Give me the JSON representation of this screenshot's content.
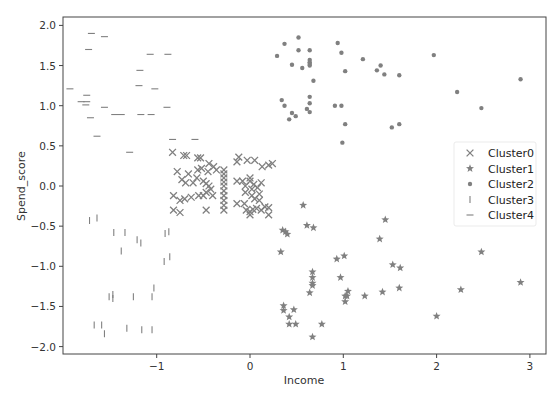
{
  "chart_data": {
    "type": "scatter",
    "title": "",
    "xlabel": "Income",
    "ylabel": "Spend_score",
    "xlim": [
      -1.98,
      3.18
    ],
    "ylim": [
      -2.1,
      2.1
    ],
    "xticks": [
      -1,
      0,
      1,
      2,
      3
    ],
    "xtick_labels": [
      "−1",
      "0",
      "1",
      "2",
      "3"
    ],
    "yticks": [
      -2.0,
      -1.5,
      -1.0,
      -0.5,
      0.0,
      0.5,
      1.0,
      1.5,
      2.0
    ],
    "ytick_labels": [
      "−2.0",
      "−1.5",
      "−1.0",
      "−0.5",
      "0.0",
      "0.5",
      "1.0",
      "1.5",
      "2.0"
    ],
    "grid": false,
    "legend_position": "center right",
    "marker_color": "#808080",
    "series": [
      {
        "name": "Cluster0",
        "marker": "x",
        "points": [
          [
            -0.83,
            0.42
          ],
          [
            -0.71,
            0.38
          ],
          [
            -0.68,
            0.38
          ],
          [
            -0.56,
            0.35
          ],
          [
            -0.53,
            0.35
          ],
          [
            -0.44,
            0.28
          ],
          [
            -0.78,
            0.18
          ],
          [
            -0.66,
            0.15
          ],
          [
            -0.56,
            0.2
          ],
          [
            -0.52,
            0.22
          ],
          [
            -0.45,
            0.18
          ],
          [
            -0.39,
            0.24
          ],
          [
            -0.36,
            0.2
          ],
          [
            -0.73,
            0.08
          ],
          [
            -0.69,
            0.04
          ],
          [
            -0.61,
            0.04
          ],
          [
            -0.57,
            0.1
          ],
          [
            -0.5,
            0.06
          ],
          [
            -0.47,
            0.03
          ],
          [
            -0.44,
            0.0
          ],
          [
            -0.42,
            -0.04
          ],
          [
            -0.47,
            -0.08
          ],
          [
            -0.4,
            -0.12
          ],
          [
            -0.5,
            -0.12
          ],
          [
            -0.82,
            -0.12
          ],
          [
            -0.75,
            -0.18
          ],
          [
            -0.7,
            -0.16
          ],
          [
            -0.63,
            -0.14
          ],
          [
            -0.55,
            -0.12
          ],
          [
            -0.82,
            -0.3
          ],
          [
            -0.75,
            -0.33
          ],
          [
            -0.47,
            -0.3
          ],
          [
            -0.28,
            0.2
          ],
          [
            -0.28,
            0.15
          ],
          [
            -0.28,
            0.1
          ],
          [
            -0.28,
            0.05
          ],
          [
            -0.28,
            0.0
          ],
          [
            -0.28,
            -0.06
          ],
          [
            -0.28,
            -0.12
          ],
          [
            -0.28,
            -0.18
          ],
          [
            -0.28,
            -0.24
          ],
          [
            -0.28,
            -0.3
          ],
          [
            -0.14,
            0.3
          ],
          [
            -0.12,
            0.36
          ],
          [
            -0.03,
            0.32
          ],
          [
            0.05,
            0.32
          ],
          [
            0.13,
            0.24
          ],
          [
            0.2,
            0.26
          ],
          [
            0.24,
            0.28
          ],
          [
            -0.14,
            0.06
          ],
          [
            -0.08,
            0.06
          ],
          [
            0.0,
            0.1
          ],
          [
            0.0,
            0.06
          ],
          [
            0.04,
            0.02
          ],
          [
            -0.05,
            0.0
          ],
          [
            -0.05,
            -0.08
          ],
          [
            0.02,
            -0.04
          ],
          [
            0.08,
            -0.02
          ],
          [
            0.12,
            0.04
          ],
          [
            0.02,
            -0.12
          ],
          [
            0.1,
            -0.1
          ],
          [
            0.05,
            -0.16
          ],
          [
            0.1,
            -0.18
          ],
          [
            -0.14,
            -0.22
          ],
          [
            -0.06,
            -0.22
          ],
          [
            -0.04,
            -0.3
          ],
          [
            0.0,
            -0.32
          ],
          [
            0.03,
            -0.29
          ],
          [
            0.07,
            -0.28
          ],
          [
            0.12,
            -0.3
          ],
          [
            0.16,
            -0.26
          ],
          [
            0.2,
            -0.27
          ],
          [
            0.2,
            -0.36
          ],
          [
            0.0,
            -0.36
          ]
        ]
      },
      {
        "name": "Cluster1",
        "marker": "*",
        "points": [
          [
            0.57,
            -0.24
          ],
          [
            0.35,
            -0.55
          ],
          [
            0.38,
            -0.57
          ],
          [
            0.4,
            -0.6
          ],
          [
            0.61,
            -0.49
          ],
          [
            0.68,
            -0.52
          ],
          [
            0.33,
            -0.82
          ],
          [
            1.45,
            -0.42
          ],
          [
            1.39,
            -0.66
          ],
          [
            0.93,
            -0.91
          ],
          [
            1.01,
            -0.87
          ],
          [
            1.53,
            -0.98
          ],
          [
            1.61,
            -1.02
          ],
          [
            2.48,
            -0.82
          ],
          [
            0.67,
            -1.07
          ],
          [
            0.67,
            -1.14
          ],
          [
            0.67,
            -1.21
          ],
          [
            0.67,
            -1.24
          ],
          [
            0.97,
            -1.14
          ],
          [
            1.05,
            -1.31
          ],
          [
            1.02,
            -1.37
          ],
          [
            1.04,
            -1.37
          ],
          [
            1.23,
            -1.37
          ],
          [
            1.42,
            -1.32
          ],
          [
            1.6,
            -1.27
          ],
          [
            2.26,
            -1.29
          ],
          [
            2.9,
            -1.2
          ],
          [
            0.64,
            -1.33
          ],
          [
            0.36,
            -1.49
          ],
          [
            0.36,
            -1.55
          ],
          [
            0.47,
            -1.54
          ],
          [
            0.42,
            -1.63
          ],
          [
            0.42,
            -1.72
          ],
          [
            0.49,
            -1.72
          ],
          [
            0.77,
            -1.72
          ],
          [
            0.67,
            -1.88
          ],
          [
            1.02,
            -1.44
          ],
          [
            2.0,
            -1.62
          ]
        ]
      },
      {
        "name": "Cluster2",
        "marker": ".",
        "points": [
          [
            0.29,
            1.62
          ],
          [
            0.37,
            1.77
          ],
          [
            0.52,
            1.85
          ],
          [
            0.52,
            1.69
          ],
          [
            0.45,
            1.51
          ],
          [
            0.56,
            1.47
          ],
          [
            0.64,
            1.69
          ],
          [
            0.64,
            1.57
          ],
          [
            0.64,
            1.54
          ],
          [
            0.64,
            1.52
          ],
          [
            0.64,
            1.5
          ],
          [
            0.68,
            1.31
          ],
          [
            0.94,
            1.78
          ],
          [
            0.98,
            1.66
          ],
          [
            1.02,
            1.43
          ],
          [
            1.21,
            1.58
          ],
          [
            1.36,
            1.44
          ],
          [
            1.4,
            1.5
          ],
          [
            1.44,
            1.39
          ],
          [
            1.6,
            1.38
          ],
          [
            1.97,
            1.63
          ],
          [
            2.22,
            1.17
          ],
          [
            2.48,
            0.97
          ],
          [
            2.9,
            1.33
          ],
          [
            0.34,
            1.07
          ],
          [
            0.37,
            1.0
          ],
          [
            0.45,
            0.91
          ],
          [
            0.42,
            0.83
          ],
          [
            0.49,
            0.87
          ],
          [
            0.61,
            0.96
          ],
          [
            0.64,
            1.03
          ],
          [
            0.64,
            1.11
          ],
          [
            0.64,
            0.92
          ],
          [
            0.91,
            1.0
          ],
          [
            0.98,
            1.0
          ],
          [
            1.02,
            0.77
          ],
          [
            0.99,
            0.54
          ],
          [
            1.52,
            0.73
          ],
          [
            1.6,
            0.77
          ]
        ]
      },
      {
        "name": "Cluster3",
        "marker": "|",
        "points": [
          [
            -1.72,
            -0.43
          ],
          [
            -1.64,
            -0.4
          ],
          [
            -1.46,
            -0.58
          ],
          [
            -1.34,
            -0.58
          ],
          [
            -1.38,
            -0.81
          ],
          [
            -1.21,
            -0.67
          ],
          [
            -1.17,
            -0.71
          ],
          [
            -0.91,
            -0.59
          ],
          [
            -0.87,
            -0.57
          ],
          [
            -0.92,
            -0.94
          ],
          [
            -0.86,
            -0.88
          ],
          [
            -1.51,
            -1.38
          ],
          [
            -1.47,
            -1.4
          ],
          [
            -1.47,
            -1.35
          ],
          [
            -1.25,
            -1.38
          ],
          [
            -1.05,
            -1.38
          ],
          [
            -1.03,
            -1.27
          ],
          [
            -1.67,
            -1.73
          ],
          [
            -1.59,
            -1.73
          ],
          [
            -1.56,
            -1.84
          ],
          [
            -1.32,
            -1.77
          ],
          [
            -1.16,
            -1.79
          ],
          [
            -1.05,
            -1.79
          ]
        ]
      },
      {
        "name": "Cluster4",
        "marker": "_",
        "points": [
          [
            -1.7,
            1.9
          ],
          [
            -1.56,
            1.86
          ],
          [
            -1.73,
            1.7
          ],
          [
            -1.07,
            1.64
          ],
          [
            -0.88,
            1.64
          ],
          [
            -1.18,
            1.44
          ],
          [
            -1.93,
            1.21
          ],
          [
            -1.19,
            1.25
          ],
          [
            -1.02,
            1.21
          ],
          [
            -1.75,
            1.13
          ],
          [
            -1.81,
            1.05
          ],
          [
            -1.76,
            1.01
          ],
          [
            -1.75,
            1.05
          ],
          [
            -1.56,
            0.98
          ],
          [
            -1.45,
            0.89
          ],
          [
            -1.38,
            0.89
          ],
          [
            -1.17,
            0.89
          ],
          [
            -1.06,
            0.89
          ],
          [
            -1.71,
            0.85
          ],
          [
            -0.89,
            0.98
          ],
          [
            -1.64,
            0.62
          ],
          [
            -1.29,
            0.42
          ],
          [
            -0.83,
            0.58
          ],
          [
            -0.59,
            0.58
          ]
        ]
      }
    ]
  }
}
